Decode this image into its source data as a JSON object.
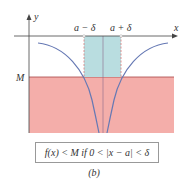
{
  "diagram": {
    "axes": {
      "x_label": "x",
      "y_label": "y"
    },
    "labels": {
      "a_minus_delta": "a − δ",
      "a_plus_delta": "a + δ",
      "M": "M"
    },
    "caption": "f(x) < M if 0 < |x − a| < δ",
    "subfigure": "(b)",
    "colors": {
      "pink_region": "#f4aeaa",
      "delta_band": "#b9dde0",
      "curve": "#6679b4",
      "axis": "#444444",
      "dashed": "#d46a6a"
    }
  }
}
